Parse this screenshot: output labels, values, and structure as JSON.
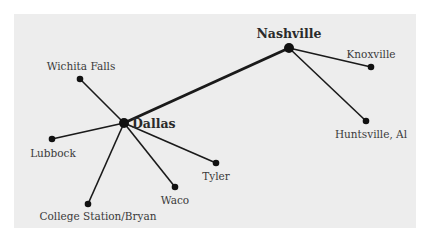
{
  "diagram": {
    "type": "hub-and-spoke network",
    "background_color": "#ededed",
    "line_color": "#1a1a1a",
    "hubs": [
      {
        "id": "dallas",
        "label": "Dallas",
        "x": 124,
        "y": 123,
        "label_x": 132,
        "label_y": 128
      },
      {
        "id": "nashville",
        "label": "Nashville",
        "x": 289,
        "y": 48,
        "label_x": 289,
        "label_y": 38
      }
    ],
    "hub_link": {
      "from": "dallas",
      "to": "nashville"
    },
    "spokes": [
      {
        "id": "wichita-falls",
        "label": "Wichita Falls",
        "hub": "dallas",
        "x": 80,
        "y": 79,
        "label_x": 81,
        "label_y": 70,
        "anchor": "middle"
      },
      {
        "id": "lubbock",
        "label": "Lubbock",
        "hub": "dallas",
        "x": 52,
        "y": 139,
        "label_x": 53,
        "label_y": 157,
        "anchor": "middle"
      },
      {
        "id": "college-station",
        "label": "College Station/Bryan",
        "hub": "dallas",
        "x": 88,
        "y": 204,
        "label_x": 98,
        "label_y": 220,
        "anchor": "middle"
      },
      {
        "id": "waco",
        "label": "Waco",
        "hub": "dallas",
        "x": 175,
        "y": 187,
        "label_x": 175,
        "label_y": 204,
        "anchor": "middle"
      },
      {
        "id": "tyler",
        "label": "Tyler",
        "hub": "dallas",
        "x": 216,
        "y": 163,
        "label_x": 216,
        "label_y": 180,
        "anchor": "middle"
      },
      {
        "id": "knoxville",
        "label": "Knoxville",
        "hub": "nashville",
        "x": 371,
        "y": 67,
        "label_x": 371,
        "label_y": 58,
        "anchor": "middle"
      },
      {
        "id": "huntsville",
        "label": "Huntsville, Al",
        "hub": "nashville",
        "x": 366,
        "y": 121,
        "label_x": 371,
        "label_y": 138,
        "anchor": "middle"
      }
    ]
  }
}
